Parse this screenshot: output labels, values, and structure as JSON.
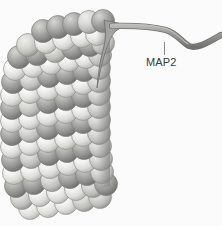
{
  "figure": {
    "background_color": "#fbfbfb",
    "width": 222,
    "height": 226
  },
  "labels": [
    {
      "id": "map2",
      "text": "MAP2",
      "x": 146,
      "y": 56,
      "leader_line": {
        "x1": 164.5,
        "y1": 42,
        "x2": 164.5,
        "y2": 55,
        "color": "#8a8a8a"
      }
    }
  ],
  "microtubule": {
    "name": "microtubule",
    "description": "Cylindrical lattice of globular tubulin subunits drawn as shaded spheres arranged in helical protofilaments",
    "sphere_radius": 11.5,
    "colors": {
      "light_subunit": "#f2f2f0",
      "light_subunit_shadow": "#b9b9b6",
      "dark_subunit": "#9e9e9c",
      "dark_subunit_shadow": "#6f6f6e",
      "outline": "#8d8d8a",
      "edge_shadow": "#9a9a98"
    },
    "rows": [
      {
        "y": 25,
        "x_start": 48,
        "count": 5,
        "shift": 0,
        "tone": "dark"
      },
      {
        "y": 38,
        "x_start": 30,
        "count": 7,
        "shift": 0,
        "tone": "light"
      },
      {
        "y": 50,
        "x_start": 18,
        "count": 8,
        "shift": 0,
        "tone": "dark"
      },
      {
        "y": 62,
        "x_start": 12,
        "count": 9,
        "shift": 0,
        "tone": "light"
      },
      {
        "y": 74,
        "x_start": 10,
        "count": 9,
        "shift": 0,
        "tone": "dark"
      },
      {
        "y": 87,
        "x_start": 10,
        "count": 9,
        "shift": 0,
        "tone": "light"
      },
      {
        "y": 100,
        "x_start": 10,
        "count": 9,
        "shift": 0,
        "tone": "dark"
      },
      {
        "y": 113,
        "x_start": 10,
        "count": 9,
        "shift": 0,
        "tone": "light"
      },
      {
        "y": 126,
        "x_start": 10,
        "count": 9,
        "shift": 0,
        "tone": "dark"
      },
      {
        "y": 139,
        "x_start": 10,
        "count": 9,
        "shift": 0,
        "tone": "light"
      },
      {
        "y": 152,
        "x_start": 10,
        "count": 9,
        "shift": 0,
        "tone": "dark"
      },
      {
        "y": 165,
        "x_start": 10,
        "count": 9,
        "shift": 0,
        "tone": "light"
      },
      {
        "y": 178,
        "x_start": 10,
        "count": 9,
        "shift": 0,
        "tone": "dark"
      },
      {
        "y": 191,
        "x_start": 12,
        "count": 8,
        "shift": 0,
        "tone": "light"
      },
      {
        "y": 204,
        "x_start": 22,
        "count": 6,
        "shift": 0,
        "tone": "light"
      }
    ]
  },
  "map2_filament": {
    "name": "map2-filament",
    "description": "Tapered protein strand attached to the microtubule wall, extending right with a downward kink then rising to the right edge",
    "color": "#8c8c8a",
    "highlight_color": "#b5b5b2",
    "outline_color": "#6a6a68"
  }
}
